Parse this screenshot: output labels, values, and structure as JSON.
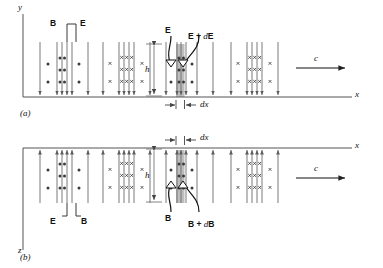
{
  "figure": {
    "type": "physics-diagram",
    "panels": [
      {
        "id": "a",
        "label": "(a)",
        "plane": "x-y",
        "vertical_axis_label": "y",
        "horizontal_axis_label": "x",
        "field_in_plane": "E",
        "field_out_of_plane": "B",
        "callout_left": "B",
        "callout_right": "E",
        "slab_label_left": "E",
        "slab_label_right": "E + dE",
        "slab_right_prefix": "E + ",
        "slab_right_italic": "d",
        "slab_right_suffix": "E",
        "height_label": "h",
        "thickness_label": "dx",
        "speed_label": "c"
      },
      {
        "id": "b",
        "label": "(b)",
        "plane": "x-z",
        "vertical_axis_label": "z",
        "horizontal_axis_label": "x",
        "field_in_plane": "B",
        "field_out_of_plane": "E",
        "callout_left": "E",
        "callout_right": "B",
        "slab_label_left": "B",
        "slab_label_right": "B + dB",
        "slab_right_prefix": "B + ",
        "slab_right_italic": "d",
        "slab_right_suffix": "B",
        "height_label": "h",
        "thickness_label": "dx",
        "speed_label": "c"
      }
    ],
    "symbols": {
      "dot": "field out of page",
      "cross": "field into page",
      "arrow_up": "field vector +",
      "arrow_down": "field vector -"
    },
    "colors": {
      "line": "#6b6b6b",
      "axis": "#555555",
      "slab_fill": "#bdbdbd",
      "text": "#111111"
    }
  }
}
